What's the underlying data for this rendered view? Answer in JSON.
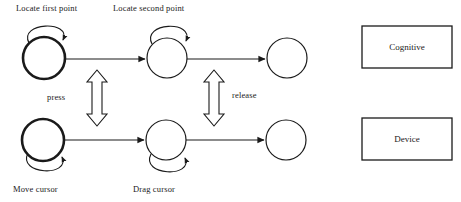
{
  "diagram": {
    "title_labels": {
      "locate_first": "Locate first point",
      "locate_second": "Locate second point",
      "move_cursor": "Move cursor",
      "drag_cursor": "Drag cursor"
    },
    "transition_labels": {
      "press": "press",
      "release": "release"
    },
    "legend": {
      "cognitive": "Cognitive",
      "device": "Device"
    },
    "colors": {
      "stroke": "#1a1a1a",
      "fill": "#ffffff",
      "background": "#ffffff"
    },
    "rows": [
      {
        "name": "cognitive-row",
        "states": [
          {
            "id": "top-state-1",
            "cx": 44,
            "cy": 58,
            "r": 21,
            "emphasis": "bold",
            "self_loop": "above",
            "label": "Locate first point"
          },
          {
            "id": "top-state-2",
            "cx": 167,
            "cy": 58,
            "r": 20,
            "emphasis": "thin",
            "self_loop": "above",
            "label": "Locate second point"
          },
          {
            "id": "top-state-3",
            "cx": 287,
            "cy": 58,
            "r": 20,
            "emphasis": "thin",
            "self_loop": "none",
            "label": ""
          }
        ]
      },
      {
        "name": "device-row",
        "states": [
          {
            "id": "bot-state-1",
            "cx": 43,
            "cy": 140,
            "r": 21,
            "emphasis": "bold",
            "self_loop": "below",
            "label": "Move cursor"
          },
          {
            "id": "bot-state-2",
            "cx": 166,
            "cy": 140,
            "r": 20,
            "emphasis": "thin",
            "self_loop": "below",
            "label": "Drag cursor"
          },
          {
            "id": "bot-state-3",
            "cx": 286,
            "cy": 140,
            "r": 20,
            "emphasis": "thin",
            "self_loop": "none",
            "label": ""
          }
        ]
      }
    ],
    "vertical_connectors": [
      {
        "id": "press-connector",
        "x": 97,
        "label": "press"
      },
      {
        "id": "release-connector",
        "x": 214,
        "label": "release"
      }
    ]
  }
}
